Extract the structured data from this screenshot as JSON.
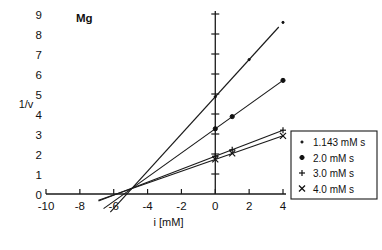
{
  "chart_data": {
    "type": "line",
    "title": "Mg",
    "xlabel": "i [mM]",
    "ylabel": "1/v",
    "xlim": [
      -10,
      4
    ],
    "ylim": [
      0,
      9
    ],
    "xticks": [
      -10,
      -8,
      -6,
      -4,
      -2,
      0,
      2,
      4
    ],
    "xtick_labels": [
      "-10",
      "-8",
      "-6",
      "-4",
      "-2",
      "0",
      "2",
      "4"
    ],
    "yticks": [
      0,
      1,
      2,
      3,
      4,
      5,
      6,
      7,
      8,
      9
    ],
    "ytick_labels": [
      "0",
      "1",
      "2",
      "3",
      "4",
      "5",
      "6",
      "7",
      "8",
      "9"
    ],
    "grid": false,
    "legend_position": "right-middle",
    "intersection_point": [
      -4.9,
      0.3
    ],
    "series": [
      {
        "name": "1.143 mM s",
        "marker": "tiny-dot",
        "slope": 0.93,
        "intercept": 4.86,
        "x": [
          0,
          2,
          4
        ],
        "y": [
          4.86,
          6.72,
          8.58
        ],
        "line_x": [
          -6.2,
          3.75
        ],
        "line_y": [
          -0.91,
          8.35
        ]
      },
      {
        "name": "2.0 mM s",
        "marker": "filled-dot",
        "slope": 0.605,
        "intercept": 3.26,
        "x": [
          0,
          1,
          4
        ],
        "y": [
          3.26,
          3.87,
          5.68
        ],
        "line_x": [
          -6.6,
          4.0
        ],
        "line_y": [
          -0.73,
          5.68
        ]
      },
      {
        "name": "3.0 mM s",
        "marker": "plus",
        "slope": 0.325,
        "intercept": 1.89,
        "x": [
          0,
          1,
          4
        ],
        "y": [
          1.89,
          2.21,
          3.19
        ],
        "line_x": [
          -6.9,
          4.0
        ],
        "line_y": [
          -0.35,
          3.19
        ]
      },
      {
        "name": "4.0 mM s",
        "marker": "cross",
        "slope": 0.295,
        "intercept": 1.73,
        "x": [
          0,
          1,
          4
        ],
        "y": [
          1.73,
          2.03,
          2.91
        ],
        "line_x": [
          -6.9,
          4.0
        ],
        "line_y": [
          -0.31,
          2.91
        ]
      }
    ]
  },
  "legend": {
    "entries": [
      {
        "marker": "tiny-dot",
        "label": "1.143 mM s"
      },
      {
        "marker": "filled-dot",
        "label": "2.0 mM s"
      },
      {
        "marker": "plus",
        "label": "3.0 mM s"
      },
      {
        "marker": "cross",
        "label": "4.0 mM s"
      }
    ]
  }
}
